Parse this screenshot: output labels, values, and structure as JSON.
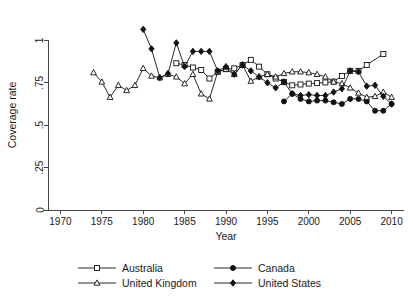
{
  "chart_data": {
    "type": "line",
    "title": "",
    "xlabel": "Year",
    "ylabel": "Coverage rate",
    "xlim": [
      1968.5,
      2011.5
    ],
    "ylim": [
      0,
      1.12
    ],
    "xticks": [
      1970,
      1975,
      1980,
      1985,
      1990,
      1995,
      2000,
      2005,
      2010
    ],
    "xtick_labels": [
      "1970",
      "1975",
      "1980",
      "1985",
      "1990",
      "1995",
      "2000",
      "2005",
      "2010"
    ],
    "yticks": [
      0,
      0.25,
      0.5,
      0.75,
      1
    ],
    "ytick_labels": [
      "0",
      ".25",
      ".5",
      ".75",
      "1"
    ],
    "grid": false,
    "legend_position": "below",
    "series": [
      {
        "name": "Australia",
        "marker": "open-square",
        "x": [
          1984,
          1985,
          1986,
          1987,
          1988,
          1989,
          1990,
          1991,
          1992,
          1993,
          1994,
          1995,
          1996,
          1997,
          1998,
          1999,
          2000,
          2001,
          2002,
          2003,
          2004,
          2005,
          2006,
          2007,
          2009
        ],
        "y": [
          0.865,
          0.855,
          0.84,
          0.825,
          0.775,
          0.815,
          0.83,
          0.835,
          0.855,
          0.885,
          0.845,
          0.8,
          0.775,
          0.755,
          0.735,
          0.74,
          0.745,
          0.748,
          0.752,
          0.757,
          0.79,
          0.82,
          0.82,
          0.855,
          0.92
        ]
      },
      {
        "name": "Canada",
        "marker": "filled-circle",
        "x": [
          1997,
          1998,
          1999,
          2000,
          2001,
          2002,
          2003,
          2004,
          2005,
          2006,
          2007,
          2008,
          2009,
          2010
        ],
        "y": [
          0.64,
          0.685,
          0.655,
          0.64,
          0.645,
          0.645,
          0.635,
          0.625,
          0.655,
          0.655,
          0.64,
          0.585,
          0.585,
          0.625
        ]
      },
      {
        "name": "United Kingdom",
        "marker": "open-triangle",
        "x": [
          1974,
          1975,
          1976,
          1977,
          1978,
          1979,
          1980,
          1981,
          1982,
          1983,
          1984,
          1985,
          1986,
          1987,
          1988,
          1989,
          1990,
          1991,
          1992,
          1993,
          1994,
          1995,
          1996,
          1997,
          1998,
          1999,
          2000,
          2001,
          2002,
          2003,
          2004,
          2005,
          2006,
          2007,
          2008,
          2009,
          2010
        ],
        "y": [
          0.81,
          0.755,
          0.665,
          0.735,
          0.705,
          0.735,
          0.835,
          0.79,
          0.78,
          0.8,
          0.785,
          0.745,
          0.8,
          0.685,
          0.655,
          0.815,
          0.83,
          0.8,
          0.855,
          0.76,
          0.785,
          0.8,
          0.785,
          0.805,
          0.815,
          0.815,
          0.81,
          0.8,
          0.785,
          0.755,
          0.745,
          0.72,
          0.69,
          0.665,
          0.67,
          0.695,
          0.665
        ]
      },
      {
        "name": "United States",
        "marker": "filled-diamond",
        "x": [
          1980,
          1981,
          1982,
          1983,
          1984,
          1985,
          1986,
          1987,
          1988,
          1989,
          1990,
          1991,
          1992,
          1993,
          1994,
          1995,
          1996,
          1997,
          1998,
          1999,
          2000,
          2001,
          2002,
          2003,
          2004,
          2005,
          2006,
          2007,
          2008,
          2009,
          2010
        ],
        "y": [
          1.065,
          0.95,
          0.78,
          0.805,
          0.985,
          0.845,
          0.935,
          0.935,
          0.935,
          0.82,
          0.845,
          0.8,
          0.855,
          0.82,
          0.785,
          0.75,
          0.72,
          0.755,
          0.685,
          0.675,
          0.68,
          0.675,
          0.675,
          0.695,
          0.715,
          0.82,
          0.815,
          0.73,
          0.735,
          0.67,
          0.625
        ]
      }
    ]
  },
  "legend": {
    "entries": [
      {
        "label": "Australia",
        "marker": "open-square"
      },
      {
        "label": "Canada",
        "marker": "filled-circle"
      },
      {
        "label": "United Kingdom",
        "marker": "open-triangle"
      },
      {
        "label": "United States",
        "marker": "filled-diamond"
      }
    ]
  },
  "colors": {
    "ink": "#111111",
    "axis": "#444444",
    "background": "#ffffff"
  }
}
